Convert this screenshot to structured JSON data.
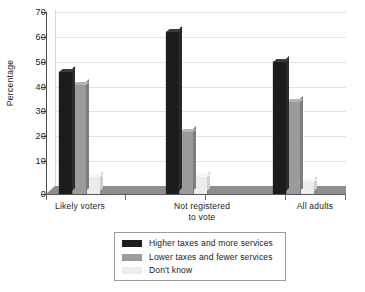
{
  "chart_data": {
    "type": "bar",
    "title": "",
    "subtitle": "",
    "xlabel": "",
    "ylabel": "Percentage",
    "ylim": [
      0,
      70
    ],
    "ytick_step": 10,
    "yticks": [
      "70",
      "60",
      "50",
      "40",
      "30",
      "20",
      "10",
      "0"
    ],
    "grid": true,
    "legend_position": "bottom-center",
    "categories": [
      "Likely voters",
      "Not registered to vote",
      "All adults"
    ],
    "series": [
      {
        "name": "Higher taxes and more services",
        "color": "#1c1c1c",
        "values": [
          49,
          65,
          53
        ]
      },
      {
        "name": "Lower taxes and fewer services",
        "color": "#9b9b9b",
        "values": [
          44,
          25,
          37
        ]
      },
      {
        "name": "Don't know",
        "color": "#ececec",
        "values": [
          7,
          7,
          5
        ]
      }
    ]
  },
  "axis": {
    "y_label": "Percentage",
    "ticks": [
      {
        "value": 70,
        "label": "70"
      },
      {
        "value": 60,
        "label": "60"
      },
      {
        "value": 50,
        "label": "50"
      },
      {
        "value": 40,
        "label": "40"
      },
      {
        "value": 30,
        "label": "30"
      },
      {
        "value": 20,
        "label": "20"
      },
      {
        "value": 10,
        "label": "10"
      },
      {
        "value": 0,
        "label": "0"
      }
    ]
  },
  "x_labels": [
    {
      "line1": "Likely voters",
      "line2": ""
    },
    {
      "line1": "Not registered",
      "line2": "to vote"
    },
    {
      "line1": "All adults",
      "line2": ""
    }
  ],
  "legend": {
    "items": [
      {
        "label": "Higher taxes and more services",
        "swatch": "k0"
      },
      {
        "label": "Lower taxes and fewer services",
        "swatch": "k1"
      },
      {
        "label": "Don't know",
        "swatch": "k2"
      }
    ]
  },
  "footer": {
    "corner_mark": ""
  }
}
